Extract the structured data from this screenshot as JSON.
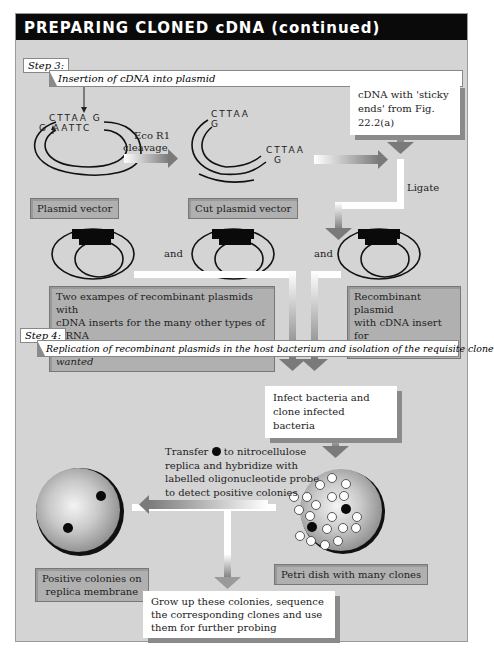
{
  "title": "PREPARING CLONED cDNA (continued)",
  "step3": {
    "tag": "Step 3:",
    "description": "Insertion of cDNA into plasmid"
  },
  "plasmid": {
    "top_seq": "CTTAA G",
    "bottom_seq": "G AATTC",
    "label": "Plasmid vector"
  },
  "cleavage": {
    "line1": "Eco R1",
    "line2": "cleavage"
  },
  "cut_plasmid": {
    "seq1_top": "CTTAA",
    "seq1_bottom": "G",
    "seq2_top": "CTTAA",
    "seq2_bottom": "G",
    "label": "Cut plasmid vector"
  },
  "cdna_box": {
    "line1": "cDNA with  'sticky",
    "line2": "ends' from Fig. 22.2(a)"
  },
  "ligate": "Ligate",
  "and_labels": [
    "and",
    "and"
  ],
  "recombinant_unwanted": {
    "line1": "Two exampes of recombinant plasmids with",
    "line2": "cDNA inserts for the many other types of mRNA",
    "line3_plain": "in liver cells, ",
    "line3_italic": "none of them specified or wanted"
  },
  "recombinant_wanted": {
    "line1": "Recombinant plasmid",
    "line2": "with cDNA insert for",
    "line3": "the required mRNA"
  },
  "step4": {
    "tag": "Step 4:",
    "description": "Replication of recombinant plasmids in the host bacterium and isolation of the requisite clone"
  },
  "infect_box": {
    "line1": "Infect bacteria and",
    "line2": "clone infected bacteria"
  },
  "transfer": {
    "line1_a": "Transfer",
    "line1_b": "to nitrocellulose",
    "line2": "replica and hybridize with",
    "line3": "labelled oligonucleotide probe",
    "line4": "to detect positive colonies"
  },
  "replica_label": {
    "line1": "Positive colonies on",
    "line2": "replica membrane"
  },
  "petri_label": "Petri dish with many clones",
  "growup_box": {
    "line1": "Grow up these colonies, sequence",
    "line2": "the corresponding clones and use",
    "line3": "them for further probing"
  },
  "colors": {
    "background": "#d4d4d4",
    "title_bar": "#0a0a0a",
    "label_box": "#b0b0b0",
    "arrow_dark": "#7a7a7a"
  }
}
